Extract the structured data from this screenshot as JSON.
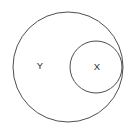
{
  "diagram": {
    "type": "venn-subset",
    "title": "",
    "background_color": "#ffffff",
    "stroke_color": "#3a3a3a",
    "label_color": "#2b2b2b",
    "sets": [
      {
        "id": "outer",
        "label": "Y",
        "icon": "circle-outline-icon",
        "cx": 68,
        "cy": 67,
        "r": 55,
        "label_x": 40,
        "label_y": 66
      },
      {
        "id": "inner",
        "label": "X",
        "icon": "circle-outline-icon",
        "cx": 96,
        "cy": 67,
        "r": 26,
        "label_x": 97,
        "label_y": 67
      }
    ]
  }
}
